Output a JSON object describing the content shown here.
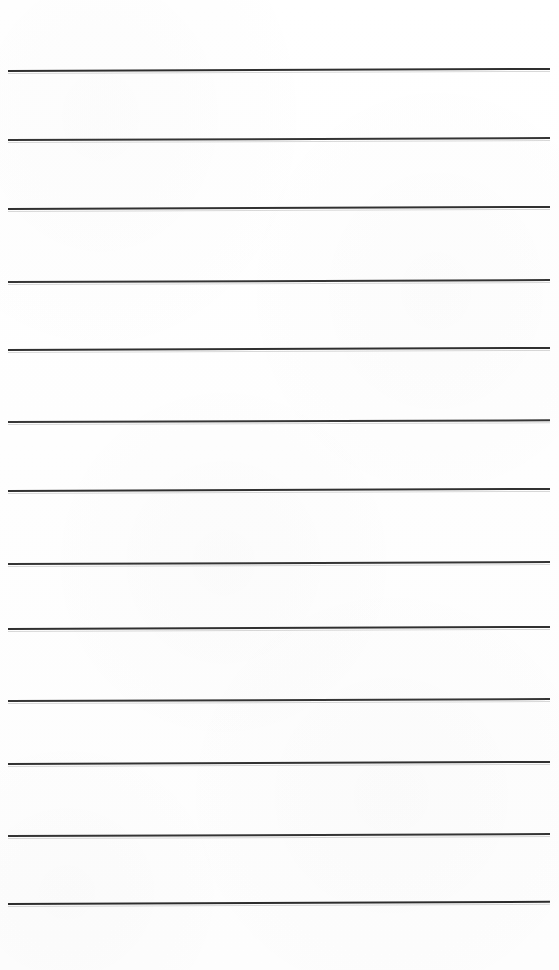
{
  "document": {
    "kind": "scanned-lined-paper",
    "title": "Blank Ruled Writing Paper",
    "page_width": 559,
    "page_height": 970,
    "background_color": "#ffffff",
    "body_text": "",
    "heading_text": "",
    "margin_note": "",
    "page_number": ""
  },
  "ruling": {
    "line_count": 13,
    "line_color": "#2b2b2b",
    "line_thickness_px": 2,
    "left_x": 8,
    "right_x": 550,
    "line_length_px": 542,
    "average_spacing_px": 69,
    "skew_deg": -0.22,
    "lines": [
      {
        "index": 1,
        "y": 70,
        "x_start": 8,
        "x_end": 550,
        "thickness": 2.0,
        "color": "#272727",
        "opacity": 0.96,
        "skew_deg": -0.22
      },
      {
        "index": 2,
        "y": 139,
        "x_start": 8,
        "x_end": 550,
        "thickness": 2.0,
        "color": "#2a2a2a",
        "opacity": 0.95,
        "skew_deg": -0.2
      },
      {
        "index": 3,
        "y": 208,
        "x_start": 8,
        "x_end": 550,
        "thickness": 2.0,
        "color": "#292929",
        "opacity": 0.96,
        "skew_deg": -0.22
      },
      {
        "index": 4,
        "y": 281,
        "x_start": 8,
        "x_end": 550,
        "thickness": 2.0,
        "color": "#2b2b2b",
        "opacity": 0.95,
        "skew_deg": -0.2
      },
      {
        "index": 5,
        "y": 349,
        "x_start": 8,
        "x_end": 550,
        "thickness": 2.0,
        "color": "#282828",
        "opacity": 0.96,
        "skew_deg": -0.22
      },
      {
        "index": 6,
        "y": 421,
        "x_start": 8,
        "x_end": 550,
        "thickness": 2.0,
        "color": "#2b2b2b",
        "opacity": 0.94,
        "skew_deg": -0.18
      },
      {
        "index": 7,
        "y": 490,
        "x_start": 8,
        "x_end": 550,
        "thickness": 2.0,
        "color": "#292929",
        "opacity": 0.96,
        "skew_deg": -0.22
      },
      {
        "index": 8,
        "y": 563,
        "x_start": 8,
        "x_end": 550,
        "thickness": 2.0,
        "color": "#2a2a2a",
        "opacity": 0.95,
        "skew_deg": -0.2
      },
      {
        "index": 9,
        "y": 628,
        "x_start": 8,
        "x_end": 550,
        "thickness": 2.0,
        "color": "#282828",
        "opacity": 0.96,
        "skew_deg": -0.22
      },
      {
        "index": 10,
        "y": 700,
        "x_start": 8,
        "x_end": 550,
        "thickness": 2.0,
        "color": "#2b2b2b",
        "opacity": 0.95,
        "skew_deg": -0.2
      },
      {
        "index": 11,
        "y": 763,
        "x_start": 8,
        "x_end": 550,
        "thickness": 2.0,
        "color": "#292929",
        "opacity": 0.96,
        "skew_deg": -0.22
      },
      {
        "index": 12,
        "y": 835,
        "x_start": 8,
        "x_end": 550,
        "thickness": 2.0,
        "color": "#2a2a2a",
        "opacity": 0.95,
        "skew_deg": -0.2
      },
      {
        "index": 13,
        "y": 903,
        "x_start": 8,
        "x_end": 550,
        "thickness": 2.2,
        "color": "#262626",
        "opacity": 0.97,
        "skew_deg": -0.24
      }
    ]
  }
}
